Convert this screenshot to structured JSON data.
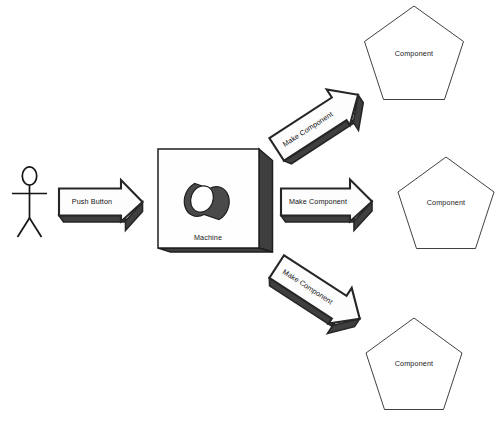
{
  "diagram": {
    "background_color": "#ffffff",
    "actor": {
      "name": "stick-figure-actor",
      "label": ""
    },
    "machine": {
      "label": "Machine",
      "front_fill": "#fefefe",
      "side_fill": "#3f3f3f",
      "outline": "#1f1f1f",
      "cylinder": {
        "body_fill": "#4a4a4a",
        "cap_fill": "#ffffff"
      }
    },
    "arrows": [
      {
        "id": "push-button-arrow",
        "label": "Push Button",
        "direction": "right",
        "rotation_deg": 0,
        "face_fill": "#fdfdfd",
        "shadow_fill": "#3f3f3f"
      },
      {
        "id": "make-component-arrow-top",
        "label": "Make Component",
        "direction": "up-right",
        "rotation_deg": -33,
        "face_fill": "#fdfdfd",
        "shadow_fill": "#3f3f3f"
      },
      {
        "id": "make-component-arrow-middle",
        "label": "Make Component",
        "direction": "right",
        "rotation_deg": 0,
        "face_fill": "#fdfdfd",
        "shadow_fill": "#3f3f3f"
      },
      {
        "id": "make-component-arrow-bottom",
        "label": "Make Component",
        "direction": "down-right",
        "rotation_deg": 33,
        "face_fill": "#fdfdfd",
        "shadow_fill": "#3f3f3f"
      }
    ],
    "components": [
      {
        "id": "component-top",
        "label": "Component",
        "shape": "pentagon",
        "fill": "#ffffff",
        "stroke": "#2b2b2b"
      },
      {
        "id": "component-middle",
        "label": "Component",
        "shape": "pentagon",
        "fill": "#ffffff",
        "stroke": "#2b2b2b"
      },
      {
        "id": "component-bottom",
        "label": "Component",
        "shape": "pentagon",
        "fill": "#ffffff",
        "stroke": "#2b2b2b"
      }
    ]
  }
}
